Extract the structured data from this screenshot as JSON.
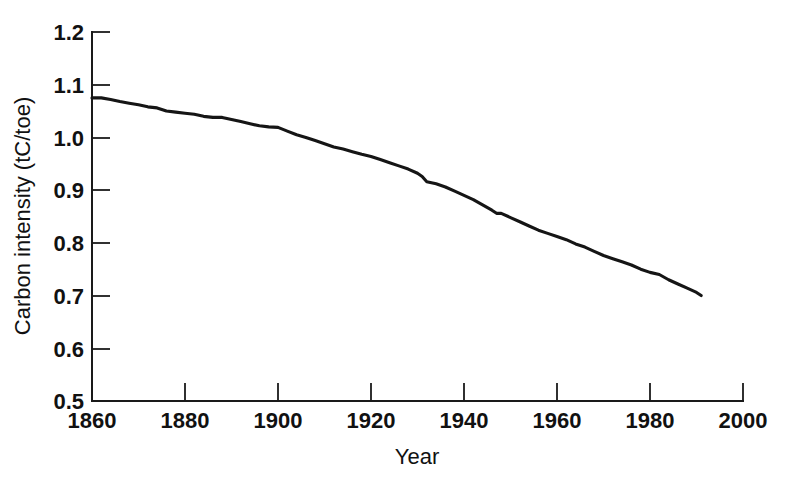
{
  "chart_data": {
    "type": "line",
    "title": "",
    "xlabel": "Year",
    "ylabel": "Carbon intensity (tC/toe)",
    "xlim": [
      1860,
      2000
    ],
    "ylim": [
      0.5,
      1.2
    ],
    "grid": false,
    "legend": null,
    "xticks": [
      1860,
      1880,
      1900,
      1920,
      1940,
      1960,
      1980,
      2000
    ],
    "xtick_labels": [
      "1860",
      "1880",
      "1900",
      "1920",
      "1940",
      "1960",
      "1980",
      "2000"
    ],
    "yticks": [
      0.5,
      0.6,
      0.7,
      0.8,
      0.9,
      1.0,
      1.1,
      1.2
    ],
    "ytick_labels": [
      "0.5",
      "0.6",
      "0.7",
      "0.8",
      "0.9",
      "1.0",
      "1.1",
      "1.2"
    ],
    "series": [
      {
        "name": "Carbon intensity",
        "color": "#151515",
        "x": [
          1860,
          1862,
          1864,
          1866,
          1868,
          1870,
          1872,
          1874,
          1876,
          1878,
          1880,
          1882,
          1884,
          1886,
          1888,
          1890,
          1892,
          1894,
          1896,
          1898,
          1900,
          1902,
          1904,
          1906,
          1908,
          1910,
          1912,
          1914,
          1916,
          1918,
          1920,
          1922,
          1924,
          1926,
          1928,
          1930,
          1931,
          1932,
          1934,
          1936,
          1938,
          1940,
          1942,
          1944,
          1946,
          1947,
          1948,
          1950,
          1952,
          1954,
          1956,
          1958,
          1960,
          1962,
          1964,
          1966,
          1968,
          1970,
          1972,
          1974,
          1976,
          1978,
          1980,
          1982,
          1984,
          1986,
          1988,
          1990,
          1991
        ],
        "y": [
          1.075,
          1.075,
          1.072,
          1.068,
          1.065,
          1.062,
          1.058,
          1.056,
          1.05,
          1.048,
          1.046,
          1.044,
          1.04,
          1.038,
          1.038,
          1.034,
          1.03,
          1.026,
          1.022,
          1.02,
          1.019,
          1.012,
          1.005,
          1.0,
          0.994,
          0.988,
          0.982,
          0.978,
          0.973,
          0.968,
          0.964,
          0.958,
          0.952,
          0.946,
          0.94,
          0.932,
          0.926,
          0.916,
          0.912,
          0.906,
          0.898,
          0.89,
          0.882,
          0.872,
          0.862,
          0.856,
          0.856,
          0.848,
          0.84,
          0.832,
          0.824,
          0.818,
          0.812,
          0.806,
          0.798,
          0.792,
          0.784,
          0.776,
          0.77,
          0.764,
          0.758,
          0.75,
          0.744,
          0.74,
          0.73,
          0.722,
          0.714,
          0.706,
          0.7
        ]
      }
    ],
    "data_start_year": 1860,
    "data_end_year": 1991,
    "data_start_value": 1.075,
    "data_end_value": 0.7
  }
}
